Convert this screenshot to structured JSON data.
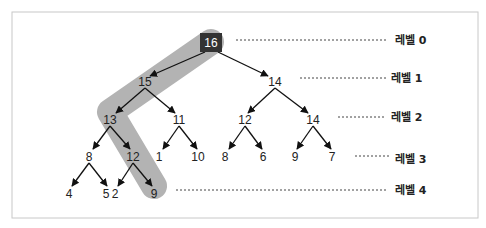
{
  "diagram": {
    "type": "max-heap-tree",
    "frame": {
      "x": 12,
      "y": 12,
      "width": 466,
      "height": 206,
      "border_color": "#c8c8c8"
    },
    "colors": {
      "highlight": "#b3b3b3",
      "root_fill": "#333333",
      "root_text": "#ffffff",
      "edge": "#111111",
      "text": "#222222",
      "dotted": "#444444"
    },
    "highlight_path": [
      {
        "x": 211,
        "y": 42
      },
      {
        "x": 110,
        "y": 112
      },
      {
        "x": 154,
        "y": 186
      }
    ],
    "nodes": [
      {
        "id": "n0",
        "value": "16",
        "x": 211,
        "y": 43,
        "level": 0,
        "root": true
      },
      {
        "id": "n1",
        "value": "15",
        "x": 145,
        "y": 82,
        "level": 1
      },
      {
        "id": "n2",
        "value": "14",
        "x": 275,
        "y": 82,
        "level": 1
      },
      {
        "id": "n3",
        "value": "13",
        "x": 110,
        "y": 120,
        "level": 2
      },
      {
        "id": "n4",
        "value": "11",
        "x": 179,
        "y": 120,
        "level": 2
      },
      {
        "id": "n5",
        "value": "12",
        "x": 245,
        "y": 120,
        "level": 2
      },
      {
        "id": "n6",
        "value": "14",
        "x": 313,
        "y": 120,
        "level": 2
      },
      {
        "id": "n7",
        "value": "8",
        "x": 89,
        "y": 157,
        "level": 3
      },
      {
        "id": "n8",
        "value": "12",
        "x": 133,
        "y": 157,
        "level": 3
      },
      {
        "id": "n9",
        "value": "1",
        "x": 159,
        "y": 157,
        "level": 3
      },
      {
        "id": "n10",
        "value": "10",
        "x": 198,
        "y": 157,
        "level": 3
      },
      {
        "id": "n11",
        "value": "8",
        "x": 225,
        "y": 157,
        "level": 3
      },
      {
        "id": "n12",
        "value": "6",
        "x": 263,
        "y": 157,
        "level": 3
      },
      {
        "id": "n13",
        "value": "9",
        "x": 295,
        "y": 157,
        "level": 3
      },
      {
        "id": "n14",
        "value": "7",
        "x": 332,
        "y": 157,
        "level": 3
      },
      {
        "id": "n15",
        "value": "4",
        "x": 69,
        "y": 194,
        "level": 4
      },
      {
        "id": "n16",
        "value": "5",
        "x": 106,
        "y": 194,
        "level": 4
      },
      {
        "id": "n17",
        "value": "2",
        "x": 115,
        "y": 194,
        "level": 4
      },
      {
        "id": "n18",
        "value": "9",
        "x": 154,
        "y": 194,
        "level": 4
      }
    ],
    "edges": [
      {
        "from": [
          205,
          52
        ],
        "to": [
          150,
          76
        ]
      },
      {
        "from": [
          218,
          52
        ],
        "to": [
          268,
          76
        ]
      },
      {
        "from": [
          145,
          88
        ],
        "to": [
          116,
          113
        ]
      },
      {
        "from": [
          145,
          88
        ],
        "to": [
          175,
          113
        ]
      },
      {
        "from": [
          275,
          88
        ],
        "to": [
          248,
          113
        ]
      },
      {
        "from": [
          275,
          88
        ],
        "to": [
          308,
          113
        ]
      },
      {
        "from": [
          110,
          126
        ],
        "to": [
          93,
          149
        ]
      },
      {
        "from": [
          110,
          126
        ],
        "to": [
          130,
          149
        ]
      },
      {
        "from": [
          179,
          126
        ],
        "to": [
          163,
          149
        ]
      },
      {
        "from": [
          179,
          126
        ],
        "to": [
          197,
          149
        ]
      },
      {
        "from": [
          245,
          126
        ],
        "to": [
          229,
          149
        ]
      },
      {
        "from": [
          245,
          126
        ],
        "to": [
          262,
          149
        ]
      },
      {
        "from": [
          313,
          126
        ],
        "to": [
          297,
          149
        ]
      },
      {
        "from": [
          313,
          126
        ],
        "to": [
          331,
          149
        ]
      },
      {
        "from": [
          89,
          163
        ],
        "to": [
          72,
          186
        ]
      },
      {
        "from": [
          89,
          163
        ],
        "to": [
          107,
          186
        ]
      },
      {
        "from": [
          133,
          163
        ],
        "to": [
          118,
          186
        ]
      },
      {
        "from": [
          133,
          163
        ],
        "to": [
          152,
          186
        ]
      }
    ],
    "levels": [
      {
        "label": "레벨 0",
        "x": 395,
        "y": 44,
        "dots_x1": 236,
        "dots_x2": 388,
        "dots_y": 40
      },
      {
        "label": "레벨 1",
        "x": 391,
        "y": 82,
        "dots_x1": 300,
        "dots_x2": 386,
        "dots_y": 78
      },
      {
        "label": "레벨 2",
        "x": 391,
        "y": 121,
        "dots_x1": 338,
        "dots_x2": 386,
        "dots_y": 117
      },
      {
        "label": "레벨 3",
        "x": 395,
        "y": 163,
        "dots_x1": 355,
        "dots_x2": 390,
        "dots_y": 156
      },
      {
        "label": "레벨 4",
        "x": 395,
        "y": 194,
        "dots_x1": 176,
        "dots_x2": 388,
        "dots_y": 190
      }
    ]
  }
}
